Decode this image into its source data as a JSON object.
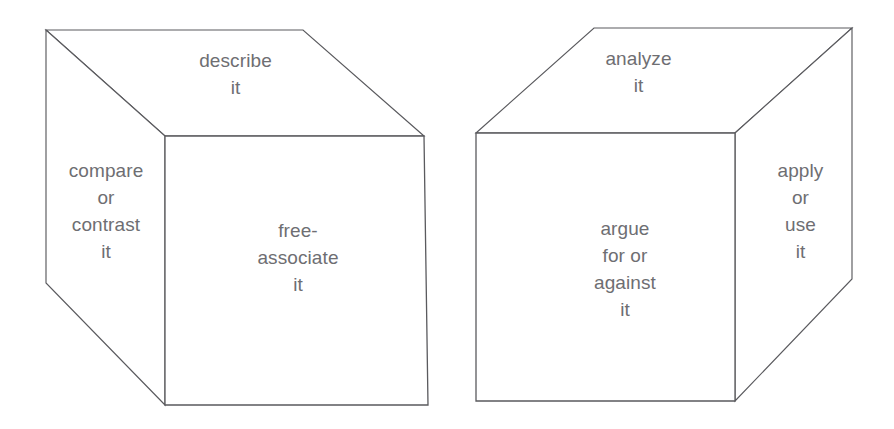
{
  "diagram": {
    "background_color": "#ffffff",
    "stroke_color": "#5a5a5e",
    "text_color": "#6e6e72",
    "cubes": [
      {
        "name": "left-cube",
        "faces": {
          "top": {
            "label": "describe\nit",
            "lines": [
              "describe",
              "it"
            ]
          },
          "left": {
            "label": "compare\nor\ncontrast\nit",
            "lines": [
              "compare",
              "or",
              "contrast",
              "it"
            ]
          },
          "front": {
            "label": "free-\nassociate\nit",
            "lines": [
              "free-",
              "associate",
              "it"
            ]
          }
        },
        "geometry": {
          "top_face_points": "46,30 303,30 424,136 165,136",
          "front_face_points": "165,136 424,136 428,405 165,405",
          "left_face_points": "46,30 165,136 165,405 46,283"
        }
      },
      {
        "name": "right-cube",
        "faces": {
          "top": {
            "label": "analyze\nit",
            "lines": [
              "analyze",
              "it"
            ]
          },
          "front": {
            "label": "argue\nfor or\nagainst\nit",
            "lines": [
              "argue",
              "for or",
              "against",
              "it"
            ]
          },
          "right": {
            "label": "apply\nor\nuse\nit",
            "lines": [
              "apply",
              "or",
              "use",
              "it"
            ]
          }
        },
        "geometry": {
          "top_face_points": "594,28 852,28 735,133 476,133",
          "front_face_points": "476,133 735,133 735,401 476,401",
          "right_face_points": "735,133 852,28 852,279 735,401"
        }
      }
    ]
  }
}
